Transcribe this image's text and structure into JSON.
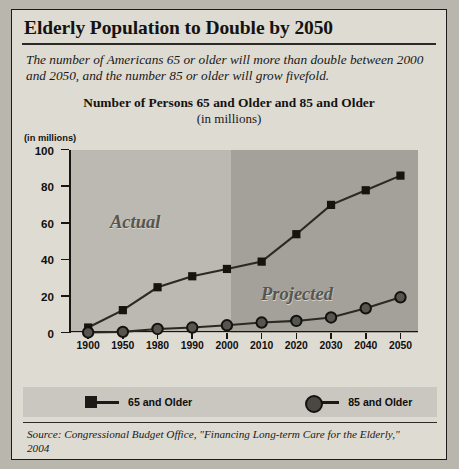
{
  "headline": "Elderly Population to Double by 2050",
  "deck": "The number of Americans 65 or older will more than double between 2000 and 2050, and the number 85 or older will grow fivefold.",
  "chart_title": "Number of Persons 65 and Older and 85 and Older",
  "chart_subtitle": "(in millions)",
  "units_label": "(in millions)",
  "region_labels": {
    "actual": "Actual",
    "projected": "Projected"
  },
  "legend": [
    {
      "label": "65 and Older",
      "marker": "square-marker-icon",
      "color": "#1b1a17"
    },
    {
      "label": "85 and Older",
      "marker": "circle-marker-icon",
      "color": "#4a4842"
    }
  ],
  "source": "Source: Congressional Budget Office, \"Financing Long-term Care for the Elderly,\" 2004",
  "colors": {
    "page_background": "#b9b6ae",
    "panel_background": "#dedbd3",
    "actual_band": "#bbb9b1",
    "projected_band": "#a3a199",
    "axis": "#171612",
    "ink": "#14130f",
    "legend_band": "#c9c7bf"
  },
  "chart_data": {
    "type": "line",
    "title": "Number of Persons 65 and Older and 85 and Older",
    "subtitle": "(in millions)",
    "xlabel": "",
    "ylabel": "(in millions)",
    "ylim": [
      0,
      100
    ],
    "yticks": [
      0,
      20,
      40,
      60,
      80,
      100
    ],
    "grid": false,
    "legend_position": "bottom",
    "categories": [
      "1900",
      "1950",
      "1980",
      "1990",
      "2000",
      "2010",
      "2020",
      "2030",
      "2040",
      "2050"
    ],
    "series": [
      {
        "name": "65 and Older",
        "values": [
          3,
          12.5,
          25,
          31,
          35,
          39,
          54,
          70,
          78,
          86
        ]
      },
      {
        "name": "85 and Older",
        "values": [
          0.3,
          0.6,
          2.2,
          3,
          4.2,
          5.7,
          6.6,
          8.5,
          13.5,
          19.5
        ]
      }
    ],
    "annotations": [
      {
        "text": "Actual",
        "region": "1900-2000"
      },
      {
        "text": "Projected",
        "region": "2000-2050"
      }
    ]
  }
}
